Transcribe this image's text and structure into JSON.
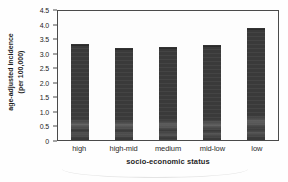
{
  "figure": {
    "background": "#fefefe"
  },
  "chart": {
    "ylabel_line1": "age-adjusted incidence",
    "ylabel_line2": "(per 100,000)",
    "xlabel": "socio-economic status",
    "yticks": [
      "4.5",
      "4.0",
      "3.5",
      "3.0",
      "2.5",
      "2.0",
      "1.5",
      "1.0",
      "0.5",
      "0"
    ]
  },
  "chart_data": {
    "type": "bar",
    "categories": [
      "high",
      "high-mid",
      "medium",
      "mid-low",
      "low"
    ],
    "values": [
      3.35,
      3.2,
      3.25,
      3.3,
      3.9
    ],
    "title": "",
    "xlabel": "socio-economic status",
    "ylabel": "age-adjusted incidence (per 100,000)",
    "ylim": [
      0,
      4.5
    ],
    "ytick_step": 0.5,
    "grid": false,
    "legend": false,
    "bar_color": "#3a3a3a",
    "axis_color": "#4a4a4a"
  }
}
